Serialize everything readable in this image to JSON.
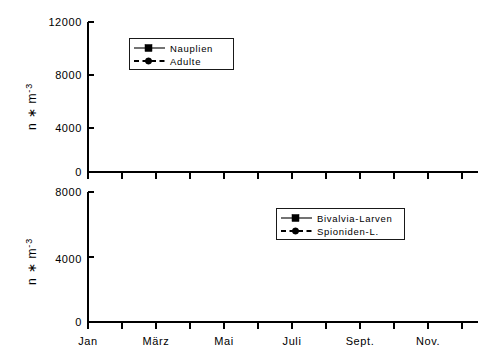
{
  "figure": {
    "background_color": "#ffffff",
    "line_color": "#000000",
    "panel_count": 2
  },
  "chart_data": [
    {
      "type": "line",
      "panel": "top",
      "title": "",
      "xlabel": "",
      "ylabel": "n * m-3",
      "ylabel_display": "n ∗ m",
      "ylabel_exponent": "-3",
      "ylim": [
        0,
        12000
      ],
      "yticks": [
        0,
        4000,
        8000,
        12000
      ],
      "ytick_labels": [
        "0",
        "4000",
        "8000",
        "12000"
      ],
      "grid": false,
      "legend_position": "upper-center-left",
      "x": [
        "Jan",
        "Feb",
        "März",
        "Apr",
        "Mai",
        "Juni",
        "Juli",
        "Aug",
        "Sept.",
        "Okt",
        "Nov.",
        "Dez"
      ],
      "xtick_labels": [
        "Jan",
        "März",
        "Mai",
        "Juli",
        "Sept.",
        "Nov."
      ],
      "xtick_indices": [
        0,
        2,
        4,
        6,
        8,
        10
      ],
      "series": [
        {
          "name": "Nauplien",
          "style": "solid",
          "marker": "square",
          "values": [
            30,
            60,
            40,
            900,
            900,
            1600,
            10700,
            1500,
            800,
            1100,
            200,
            700
          ]
        },
        {
          "name": "Adulte",
          "style": "dashed",
          "marker": "circle",
          "values": [
            20,
            30,
            30,
            120,
            130,
            700,
            3400,
            900,
            1100,
            1400,
            120,
            90
          ]
        }
      ]
    },
    {
      "type": "line",
      "panel": "bottom",
      "title": "",
      "xlabel": "",
      "ylabel": "n * m-3",
      "ylabel_display": "n ∗ m",
      "ylabel_exponent": "-3",
      "ylim": [
        0,
        8000
      ],
      "yticks": [
        0,
        4000,
        8000
      ],
      "ytick_labels": [
        "0",
        "4000",
        "8000"
      ],
      "grid": false,
      "legend_position": "upper-right-center",
      "x": [
        "Jan",
        "Feb",
        "März",
        "Apr",
        "Mai",
        "Juni",
        "Juli",
        "Aug",
        "Sept.",
        "Okt",
        "Nov.",
        "Dez"
      ],
      "xtick_labels": [
        "Jan",
        "März",
        "Mai",
        "Juli",
        "Sept.",
        "Nov."
      ],
      "xtick_indices": [
        0,
        2,
        4,
        6,
        8,
        10
      ],
      "series": [
        {
          "name": "Bivalvia-Larven",
          "style": "solid",
          "marker": "square",
          "values": [
            40,
            40,
            40,
            7950,
            7950,
            2500,
            1450,
            3100,
            150,
            20,
            30,
            120
          ]
        },
        {
          "name": "Spioniden-L.",
          "style": "dashed",
          "marker": "circle",
          "values": [
            30,
            120,
            50,
            2850,
            2850,
            3550,
            3950,
            1750,
            1850,
            700,
            250,
            200
          ]
        }
      ]
    }
  ]
}
